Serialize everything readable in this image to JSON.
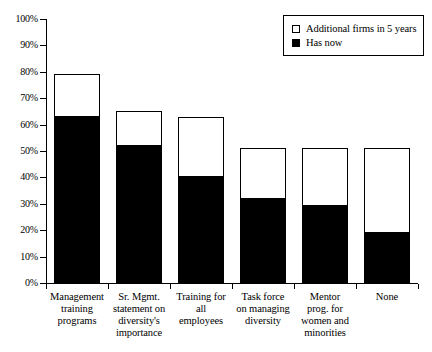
{
  "chart_data": {
    "type": "bar",
    "subtype": "stacked",
    "title": "",
    "xlabel": "",
    "ylabel": "",
    "ylim": [
      0,
      100
    ],
    "yunit": "%",
    "grid": false,
    "legend_position": "top-right",
    "categories": [
      "Management training programs",
      "Sr. Mgmt. statement on diversity's importance",
      "Training for all employees",
      "Task force on managing diversity",
      "Mentor prog. for women and minorities",
      "None"
    ],
    "category_lines": [
      [
        "Management",
        "training",
        "programs"
      ],
      [
        "Sr. Mgmt.",
        "statement on",
        "diversity's",
        "importance"
      ],
      [
        "Training for",
        "all",
        "employees"
      ],
      [
        "Task force",
        "on managing",
        "diversity"
      ],
      [
        "Mentor",
        "prog. for",
        "women and",
        "minorities"
      ],
      [
        "None"
      ]
    ],
    "series": [
      {
        "name": "Has now",
        "color": "#000000",
        "values": [
          63,
          52,
          40,
          32,
          29,
          19
        ]
      },
      {
        "name": "Additional firms in 5 years",
        "color": "#ffffff",
        "values": [
          16,
          13,
          23,
          19,
          22,
          32
        ]
      }
    ],
    "totals": [
      79,
      65,
      63,
      51,
      51,
      51
    ],
    "ytick_labels": [
      "100%",
      "90%",
      "80%",
      "70%",
      "60%",
      "50%",
      "40%",
      "30%",
      "20%",
      "10%",
      "0%"
    ],
    "ytick_values": [
      100,
      90,
      80,
      70,
      60,
      50,
      40,
      30,
      20,
      10,
      0
    ]
  },
  "legend": {
    "items": [
      {
        "label": "Additional firms in 5 years",
        "swatch": "empty"
      },
      {
        "label": "Has now",
        "swatch": "filled"
      }
    ]
  }
}
